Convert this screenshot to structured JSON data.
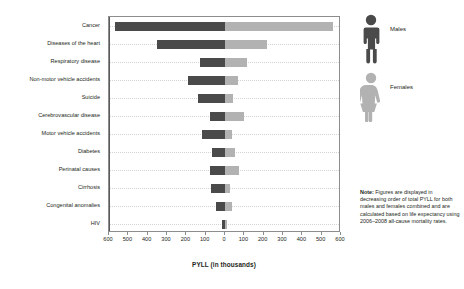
{
  "chart_data": {
    "type": "bar",
    "orientation": "horizontal-diverging",
    "title": "",
    "xlabel": "PYLL (in thousands)",
    "ylabel": "",
    "xlim": [
      -600,
      600
    ],
    "xticks": [
      600,
      500,
      400,
      300,
      200,
      100,
      0,
      100,
      200,
      300,
      400,
      500,
      600
    ],
    "grid": true,
    "legend_position": "right",
    "categories": [
      "Cancer",
      "Diseases of the heart",
      "Respiratory disease",
      "Non-motor vehicle accidents",
      "Suicide",
      "Cerebrovascular disease",
      "Motor vehicle accidents",
      "Diabetes",
      "Perinatal causes",
      "Cirrhosis",
      "Congenital anomalies",
      "HIV"
    ],
    "series": [
      {
        "name": "Males",
        "color": "#4a4a4a",
        "direction": "left",
        "values": [
          570,
          350,
          130,
          190,
          140,
          80,
          120,
          65,
          80,
          75,
          45,
          18
        ]
      },
      {
        "name": "Females",
        "color": "#b2b2b2",
        "direction": "right",
        "values": [
          560,
          215,
          115,
          65,
          42,
          100,
          35,
          50,
          70,
          25,
          38,
          8
        ]
      }
    ]
  },
  "axis": {
    "title": "PYLL (in thousands)",
    "tick_labels": [
      "600",
      "500",
      "400",
      "300",
      "200",
      "100",
      "0",
      "100",
      "200",
      "300",
      "400",
      "500",
      "600"
    ]
  },
  "legend": {
    "items": [
      {
        "label": "Males",
        "icon": "male-figure-icon",
        "color": "#4a4a4a"
      },
      {
        "label": "Females",
        "icon": "female-figure-icon",
        "color": "#b2b2b2"
      }
    ]
  },
  "note": {
    "prefix": "Note:",
    "text": " Figures are displayed in decreasing order of total PYLL for both males and females combined and are calculated based on life expectancy using 2006–2008 all-cause mortality rates."
  },
  "colors": {
    "male_bar": "#4a4a4a",
    "female_bar": "#b2b2b2",
    "axis_line": "#8d8d8d",
    "zero_line": "#58595b",
    "grid": "#d3d3d3",
    "text": "#231f20"
  }
}
